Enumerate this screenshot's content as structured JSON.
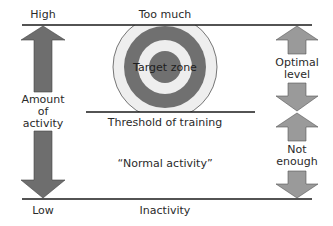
{
  "diagram": {
    "top_left_label": "High",
    "bottom_left_label": "Low",
    "top_center_label": "Too much",
    "bottom_center_label": "Inactivity",
    "target_label": "Target zone",
    "threshold_label": "Threshold of training",
    "normal_label": "“Normal activity”",
    "left_axis_label_lines": [
      "Amount",
      "of",
      "activity"
    ],
    "right_upper_label_lines": [
      "Optimal",
      "level"
    ],
    "right_lower_label_lines": [
      "Not",
      "enough"
    ],
    "colors": {
      "arrow_dark": "#6e6e6e",
      "arrow_light": "#9a9a9a",
      "ring_dark": "#707070",
      "ring_light": "#eeeeee",
      "line": "#1a1a1a"
    }
  }
}
